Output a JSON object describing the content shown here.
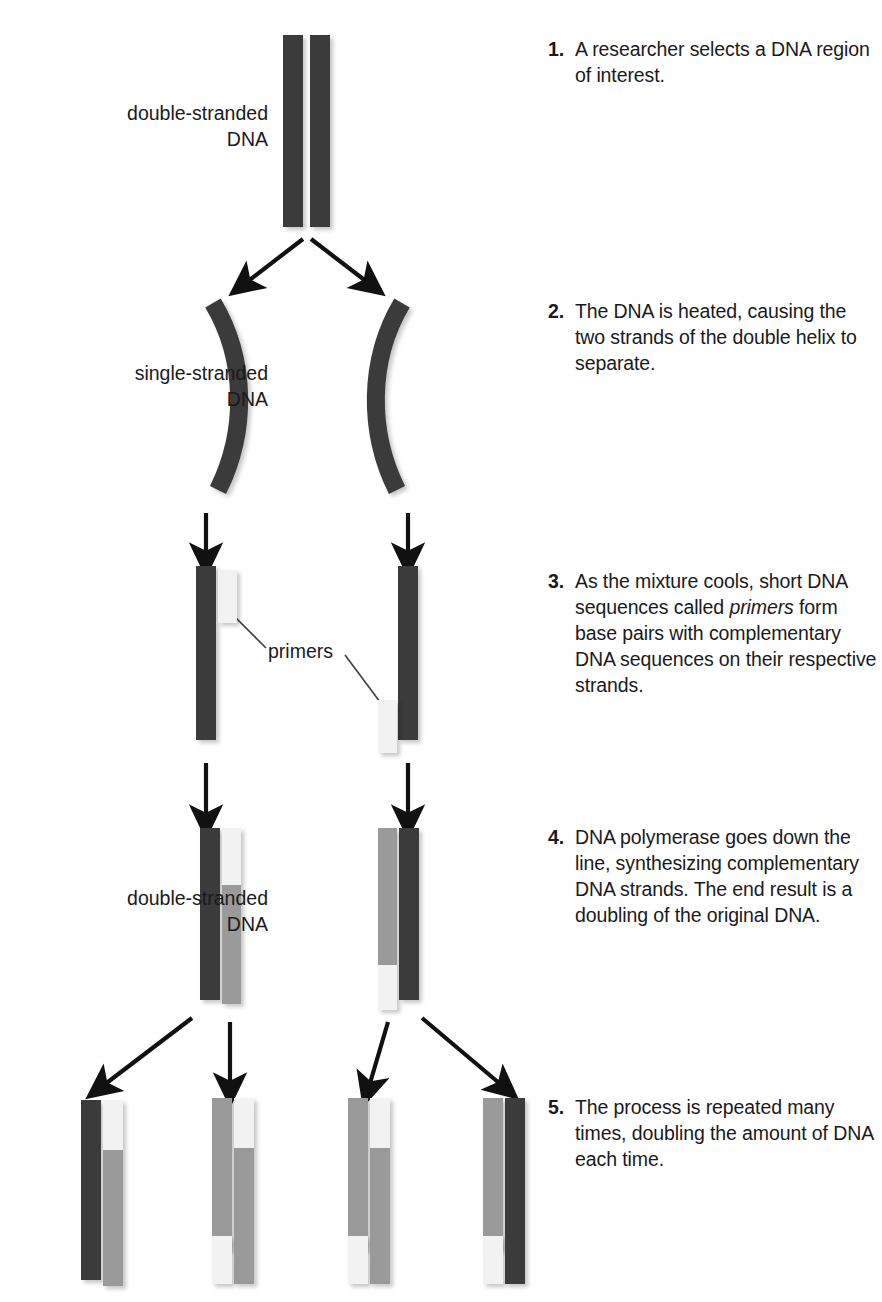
{
  "figure": {
    "colors": {
      "template_strand": "#3b3b3b",
      "new_strand": "#9a9a9a",
      "primer": "#f2f2f2",
      "text": "#1a1a1a",
      "background": "#ffffff"
    }
  },
  "steps": [
    {
      "number": "1.",
      "text": "A researcher selects a DNA region of interest."
    },
    {
      "number": "2.",
      "text": "The DNA is heated, causing the two strands of the double helix to separate."
    },
    {
      "number": "3.",
      "text_before": "As the mixture cools, short DNA sequences called ",
      "emphasis": "primers",
      "text_after": " form base pairs with complementary DNA sequences on their respective strands."
    },
    {
      "number": "4.",
      "text": "DNA polymerase goes down the line, synthesizing complementary DNA strands. The end result is a doubling of the original DNA."
    },
    {
      "number": "5.",
      "text": "The process is repeated many times, doubling the amount of DNA each time."
    }
  ],
  "labels": {
    "double_stranded_top": "double-stranded\nDNA",
    "double_stranded_top_line1": "double-stranded",
    "double_stranded_top_line2": "DNA",
    "single_stranded_line1": "single-stranded",
    "single_stranded_line2": "DNA",
    "double_stranded_bottom_line1": "double-stranded",
    "double_stranded_bottom_line2": "DNA",
    "primers": "primers"
  }
}
